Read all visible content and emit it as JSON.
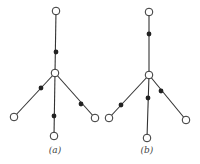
{
  "figure": {
    "colors": {
      "edge": "#333333",
      "open_node_fill": "#ffffff",
      "filled_node": "#222222",
      "label": "#444444"
    },
    "diagrams": [
      {
        "label": "(a)",
        "label_pos": [
          55,
          153
        ],
        "center": [
          55,
          73
        ],
        "open_nodes": [
          [
            56,
            11
          ],
          [
            55,
            73
          ],
          [
            14,
            117
          ],
          [
            95,
            118
          ],
          [
            54,
            136
          ]
        ],
        "filled_nodes": [
          [
            56,
            52
          ],
          [
            41,
            88
          ],
          [
            81,
            104
          ],
          [
            54,
            116
          ]
        ],
        "edges": [
          [
            [
              56,
              11
            ],
            [
              55,
              73
            ]
          ],
          [
            [
              55,
              73
            ],
            [
              14,
              117
            ]
          ],
          [
            [
              55,
              73
            ],
            [
              95,
              118
            ]
          ],
          [
            [
              55,
              73
            ],
            [
              54,
              136
            ]
          ]
        ]
      },
      {
        "label": "(b)",
        "label_pos": [
          147,
          153
        ],
        "center": [
          149,
          75
        ],
        "open_nodes": [
          [
            149,
            12
          ],
          [
            149,
            75
          ],
          [
            109,
            118
          ],
          [
            186,
            120
          ],
          [
            147,
            138
          ]
        ],
        "filled_nodes": [
          [
            149,
            34
          ],
          [
            121,
            105
          ],
          [
            161,
            91
          ],
          [
            148,
            98
          ]
        ],
        "edges": [
          [
            [
              149,
              12
            ],
            [
              149,
              75
            ]
          ],
          [
            [
              149,
              75
            ],
            [
              109,
              118
            ]
          ],
          [
            [
              149,
              75
            ],
            [
              186,
              120
            ]
          ],
          [
            [
              149,
              75
            ],
            [
              147,
              138
            ]
          ]
        ]
      }
    ]
  }
}
